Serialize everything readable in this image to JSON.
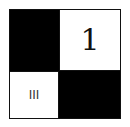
{
  "grid": {
    "cells": [
      {
        "position": "top-left",
        "fill": "#000000",
        "label": ""
      },
      {
        "position": "top-right",
        "fill": "#ffffff",
        "label": "1"
      },
      {
        "position": "bottom-left",
        "fill": "#ffffff",
        "label": "III"
      },
      {
        "position": "bottom-right",
        "fill": "#000000",
        "label": ""
      }
    ]
  }
}
